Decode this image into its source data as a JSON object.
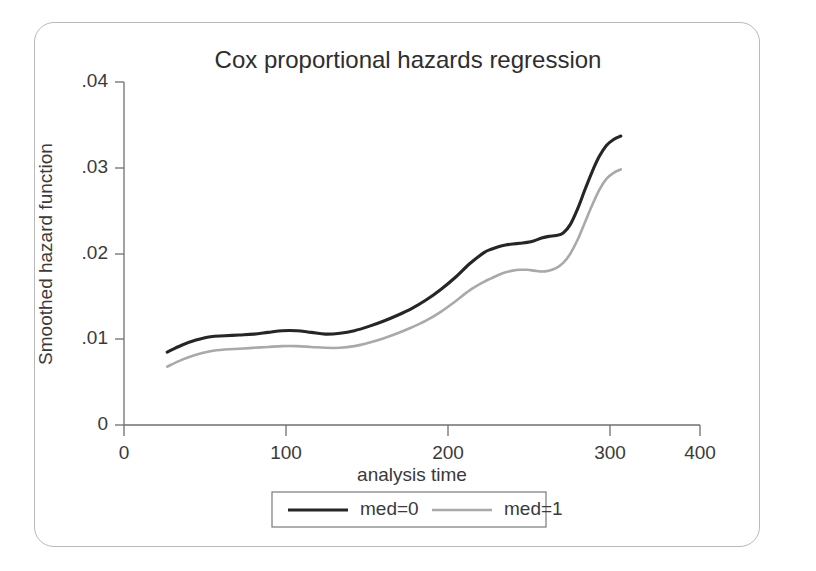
{
  "figure": {
    "title": "Cox proportional hazards regression"
  },
  "chart_data": {
    "type": "line",
    "title": "Cox proportional hazards regression",
    "xlabel": "analysis time",
    "ylabel": "Smoothed hazard function",
    "xlim": [
      0,
      400
    ],
    "ylim": [
      0,
      0.04
    ],
    "xticks": [
      0,
      100,
      200,
      300,
      400
    ],
    "xticklabels": [
      "0",
      "100",
      "200",
      "300",
      "400"
    ],
    "yticks": [
      0,
      0.01,
      0.02,
      0.03,
      0.04
    ],
    "yticklabels": [
      "0",
      ".01",
      ".02",
      ".03",
      ".04"
    ],
    "grid": false,
    "legend_position": "bottom-center",
    "x": [
      30,
      40,
      50,
      60,
      70,
      80,
      90,
      100,
      110,
      120,
      130,
      140,
      150,
      160,
      170,
      180,
      190,
      200,
      210,
      220,
      230,
      240,
      250,
      255,
      260,
      265,
      270,
      275,
      280,
      285,
      290,
      295,
      300,
      305,
      310,
      315,
      320,
      325,
      330,
      335,
      340,
      345
    ],
    "series": [
      {
        "name": "med=0",
        "color": "#262626",
        "values": [
          0.0085,
          0.0093,
          0.0099,
          0.0103,
          0.0104,
          0.0105,
          0.0106,
          0.0108,
          0.011,
          0.011,
          0.0108,
          0.0106,
          0.0107,
          0.011,
          0.0115,
          0.0121,
          0.0128,
          0.0136,
          0.0146,
          0.0158,
          0.0172,
          0.0188,
          0.0201,
          0.0205,
          0.0208,
          0.021,
          0.0211,
          0.0212,
          0.0213,
          0.0215,
          0.0218,
          0.022,
          0.0221,
          0.0224,
          0.0234,
          0.0252,
          0.0274,
          0.0295,
          0.0313,
          0.0326,
          0.0333,
          0.0337
        ]
      },
      {
        "name": "med=1",
        "color": "#a9a9a9",
        "values": [
          0.0068,
          0.0076,
          0.0082,
          0.0086,
          0.0088,
          0.0089,
          0.009,
          0.0091,
          0.0092,
          0.0092,
          0.0091,
          0.009,
          0.009,
          0.0092,
          0.0096,
          0.0101,
          0.0107,
          0.0114,
          0.0122,
          0.0132,
          0.0144,
          0.0157,
          0.0167,
          0.0171,
          0.0175,
          0.0178,
          0.018,
          0.0181,
          0.0181,
          0.018,
          0.0179,
          0.018,
          0.0183,
          0.0189,
          0.02,
          0.0216,
          0.0236,
          0.0256,
          0.0274,
          0.0287,
          0.0294,
          0.0298
        ]
      }
    ]
  },
  "legend": {
    "items": [
      {
        "label": "med=0",
        "color": "#262626"
      },
      {
        "label": "med=1",
        "color": "#a9a9a9"
      }
    ]
  }
}
